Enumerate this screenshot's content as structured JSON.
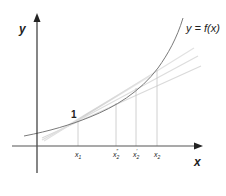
{
  "diagram": {
    "axes": {
      "y_label": "y",
      "x_label": "x"
    },
    "curve_label": "y = f(x)",
    "point_label": "1",
    "x_ticks": [
      {
        "base": "x",
        "sub": "1",
        "sup": ""
      },
      {
        "base": "x",
        "sub": "2",
        "sup": "″"
      },
      {
        "base": "x",
        "sub": "2",
        "sup": "′"
      },
      {
        "base": "x",
        "sub": "2",
        "sup": ""
      }
    ],
    "colors": {
      "axis": "#222222",
      "curve": "#7a7a7a",
      "chords": "#d8d8d8",
      "droplines": "#bdbdbd"
    }
  }
}
